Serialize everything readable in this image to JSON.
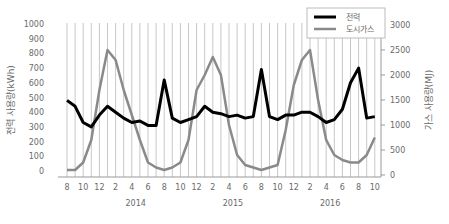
{
  "chart_data": {
    "type": "line",
    "title": "",
    "xlabel": "",
    "ylabel": "전력 사용량(kWh)",
    "ylabel_right": "가스 사용량(MJ)",
    "ylim": [
      0,
      1000
    ],
    "ylim_right": [
      0,
      3000
    ],
    "yticks_left": [
      "0",
      "100",
      "200",
      "300",
      "400",
      "500",
      "600",
      "700",
      "800",
      "900",
      "1000"
    ],
    "yticks_right": [
      "0",
      "500",
      "1000",
      "1500",
      "2000",
      "2500",
      "3000"
    ],
    "x_tick_labels": [
      "8",
      "10",
      "12",
      "2",
      "4",
      "6",
      "8",
      "10",
      "12",
      "2",
      "4",
      "6",
      "8",
      "10",
      "12",
      "2",
      "4",
      "6",
      "8",
      "10"
    ],
    "year_labels": [
      {
        "label": "2014",
        "month_index": 7
      },
      {
        "label": "2015",
        "month_index": 19
      },
      {
        "label": "2016",
        "month_index": 31
      }
    ],
    "grid": "vertical monthly gridlines",
    "legend_position": "top-right",
    "x": [
      "2013-08",
      "2013-09",
      "2013-10",
      "2013-11",
      "2013-12",
      "2014-01",
      "2014-02",
      "2014-03",
      "2014-04",
      "2014-05",
      "2014-06",
      "2014-07",
      "2014-08",
      "2014-09",
      "2014-10",
      "2014-11",
      "2014-12",
      "2015-01",
      "2015-02",
      "2015-03",
      "2015-04",
      "2015-05",
      "2015-06",
      "2015-07",
      "2015-08",
      "2015-09",
      "2015-10",
      "2015-11",
      "2015-12",
      "2016-01",
      "2016-02",
      "2016-03",
      "2016-04",
      "2016-05",
      "2016-06",
      "2016-07",
      "2016-08",
      "2016-09",
      "2016-10"
    ],
    "series": [
      {
        "name": "전력",
        "axis": "left",
        "color": "#000000",
        "values": [
          480,
          440,
          330,
          300,
          380,
          440,
          400,
          360,
          330,
          340,
          310,
          310,
          620,
          360,
          330,
          350,
          370,
          440,
          400,
          390,
          370,
          380,
          360,
          370,
          690,
          370,
          350,
          380,
          380,
          400,
          400,
          370,
          330,
          350,
          420,
          600,
          700,
          360,
          370
        ]
      },
      {
        "name": "도시가스",
        "axis": "right",
        "color": "#8a8a8a",
        "values": [
          100,
          100,
          250,
          700,
          1700,
          2500,
          2300,
          1700,
          1200,
          700,
          250,
          150,
          100,
          150,
          250,
          700,
          1700,
          2000,
          2360,
          2000,
          1000,
          400,
          200,
          150,
          100,
          150,
          200,
          900,
          1800,
          2300,
          2500,
          1500,
          700,
          400,
          300,
          250,
          250,
          400,
          750
        ]
      }
    ]
  },
  "legend": {
    "items": [
      {
        "label": "전력",
        "color": "#000000"
      },
      {
        "label": "도시가스",
        "color": "#8a8a8a"
      }
    ]
  }
}
